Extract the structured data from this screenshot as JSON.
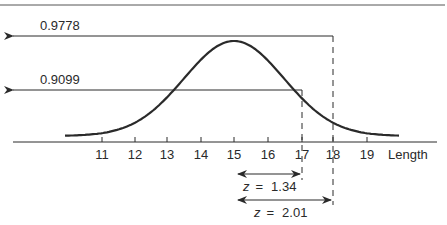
{
  "figure": {
    "type": "normal-distribution-diagram",
    "axis_label": "Length",
    "ticks": [
      "11",
      "12",
      "13",
      "14",
      "15",
      "16",
      "17",
      "18",
      "19"
    ],
    "mean": 15,
    "cumulative_markers": [
      {
        "label": "0.9778",
        "x_value": 18
      },
      {
        "label": "0.9099",
        "x_value": 17
      }
    ],
    "z_annotations": [
      {
        "label_prefix": "z",
        "equals": "=",
        "value": "1.34",
        "to_x_value": 17
      },
      {
        "label_prefix": "z",
        "equals": "=",
        "value": "2.01",
        "to_x_value": 18
      }
    ],
    "colors": {
      "ink": "#2a2a2a",
      "background": "#ffffff"
    }
  }
}
